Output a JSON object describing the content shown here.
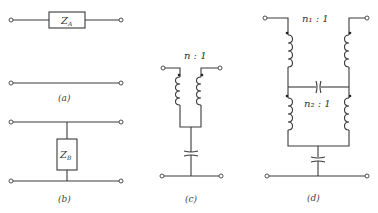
{
  "figure": {
    "panels": [
      {
        "id": "a",
        "caption": "(a)",
        "element": {
          "label": "Z",
          "subscript": "A"
        },
        "type": "series-impedance"
      },
      {
        "id": "b",
        "caption": "(b)",
        "element": {
          "label": "Z",
          "subscript": "B"
        },
        "type": "shunt-impedance"
      },
      {
        "id": "c",
        "caption": "(c)",
        "ratio_label": "n : 1",
        "type": "transformer-with-shunt-capacitor"
      },
      {
        "id": "d",
        "caption": "(d)",
        "ratio1_label": "n₁ : 1",
        "ratio2_label": "n₂ : 1",
        "type": "double-transformer-lattice"
      }
    ]
  },
  "colors": {
    "line": "#3a3a3a",
    "text": "#333333",
    "background": "#ffffff"
  }
}
